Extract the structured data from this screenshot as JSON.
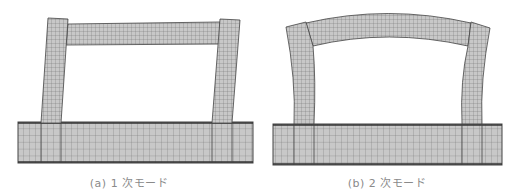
{
  "figures": [
    {
      "id": "a",
      "caption": "(a) 1 次モード",
      "mode": "1st mode – sway"
    },
    {
      "id": "b",
      "caption": "(b) 2 次モード",
      "mode": "2nd mode – arch bending"
    }
  ],
  "colors": {
    "mesh_fill": "#c8c8c8",
    "mesh_line": "#555555",
    "edge": "#333333",
    "caption": "#8a8a8a"
  }
}
